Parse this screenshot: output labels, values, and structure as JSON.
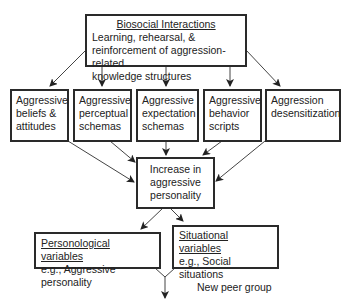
{
  "top_box": {
    "title": "Biosocial Interactions",
    "lines": [
      "Learning, rehearsal, &",
      "reinforcement of aggression-related",
      "knowledge structures"
    ]
  },
  "middle_row": [
    {
      "lines": [
        "Aggressive",
        "beliefs &",
        "attitudes"
      ]
    },
    {
      "lines": [
        "Aggressive",
        "perceptual",
        "schemas"
      ]
    },
    {
      "lines": [
        "Aggressive",
        "expectation",
        "schemas"
      ]
    },
    {
      "lines": [
        "Aggressive",
        "behavior",
        "scripts"
      ]
    },
    {
      "lines": [
        "Aggression",
        "desensitization"
      ]
    }
  ],
  "center_box": {
    "lines": [
      "Increase in",
      "aggressive",
      "personality"
    ]
  },
  "bottom_left": {
    "title": "Personological variables",
    "lines": [
      "e.g., Aggressive personality"
    ]
  },
  "bottom_right": {
    "title": "Situational variables",
    "lines": [
      "e.g., Social situations",
      "New peer group"
    ]
  },
  "colors": {
    "stroke": "#2a2a2a",
    "background": "#ffffff"
  }
}
